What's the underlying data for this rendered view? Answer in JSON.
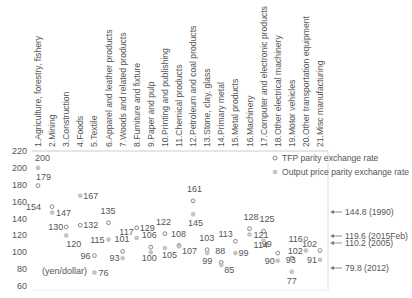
{
  "chart_data": {
    "type": "scatter",
    "title": "",
    "xlabel": "",
    "ylabel": "(yen/dollar)",
    "ylim": [
      60,
      220
    ],
    "yticks": [
      60,
      80,
      100,
      120,
      140,
      160,
      180,
      200,
      220
    ],
    "grid": false,
    "legend_position": "top-right inside",
    "categories": [
      "1.Agriculture, forestry, fishery",
      "2.Mining",
      "3.Construction",
      "4.Foods",
      "5.Textile",
      "6.Apparel and leather products",
      "7.Woods and related products",
      "8.Furniture and fixture",
      "9.Paper and pulp",
      "10.Printing and publishing",
      "11.Chemical products",
      "12.Petroleum and coal products",
      "13.Stone, clay, glass",
      "14.Primary metal",
      "15.Metal products",
      "16.Machinery",
      "17.Computer and electronic products",
      "18.Other electrical machinery",
      "19.Motor vehicles",
      "20.Other transportation equipment",
      "21.Misc manufacturing"
    ],
    "series": [
      {
        "name": "TFP parity exchange rate",
        "marker": "hollow-circle",
        "color": "#888888",
        "values": [
          179,
          154,
          130,
          132,
          96,
          135,
          101,
          129,
          106,
          122,
          108,
          161,
          103,
          88,
          113,
          128,
          125,
          99,
          93,
          116,
          102
        ]
      },
      {
        "name": "Output price parity exchange rate",
        "marker": "filled-circle",
        "color": "#bbbbbb",
        "values": [
          200,
          147,
          120,
          167,
          76,
          115,
          93,
          117,
          100,
          105,
          107,
          145,
          99,
          85,
          99,
          121,
          114,
          90,
          77,
          102,
          91
        ]
      }
    ],
    "annotations": [
      {
        "text": "144.8 (1990)",
        "value": 144.8
      },
      {
        "text": "119.6 (2015Feb)",
        "value": 119.6
      },
      {
        "text": "110.2 (2005)",
        "value": 110.2
      },
      {
        "text": "79.8 (2012)",
        "value": 79.8
      }
    ],
    "unit_label": "(yen/dollar)"
  }
}
